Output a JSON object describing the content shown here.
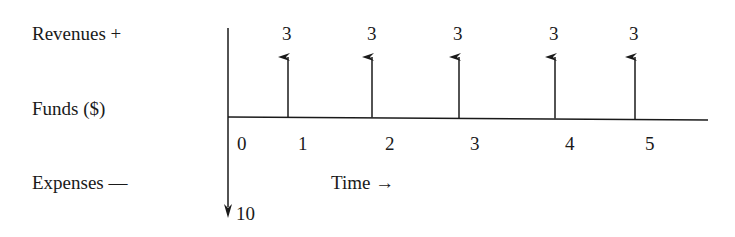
{
  "labels": {
    "revenues": "Revenues +",
    "funds": "Funds ($)",
    "expenses": "Expenses —",
    "time": "Time →"
  },
  "outflow": {
    "time": 0,
    "amount": "10"
  },
  "inflows": [
    {
      "time": 1,
      "amount": "3"
    },
    {
      "time": 2,
      "amount": "3"
    },
    {
      "time": 3,
      "amount": "3"
    },
    {
      "time": 4,
      "amount": "3"
    },
    {
      "time": 5,
      "amount": "3"
    }
  ],
  "ticks": [
    "0",
    "1",
    "2",
    "3",
    "4",
    "5"
  ],
  "colors": {
    "line": "#1a1a1a",
    "background": "#ffffff"
  }
}
